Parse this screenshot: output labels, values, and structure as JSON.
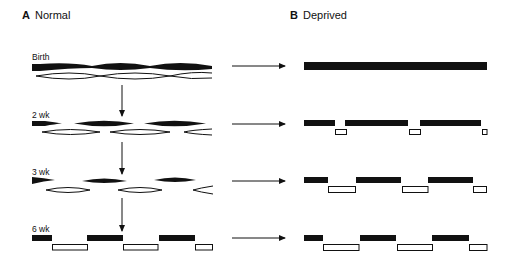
{
  "panels": {
    "a": {
      "letter": "A",
      "title": "Normal"
    },
    "b": {
      "letter": "B",
      "title": "Deprived"
    }
  },
  "rows": [
    {
      "label": "Birth"
    },
    {
      "label": "2 wk"
    },
    {
      "label": "3 wk"
    },
    {
      "label": "6 wk"
    }
  ],
  "colors": {
    "ink": "#111111",
    "fill_open": "#ffffff"
  }
}
